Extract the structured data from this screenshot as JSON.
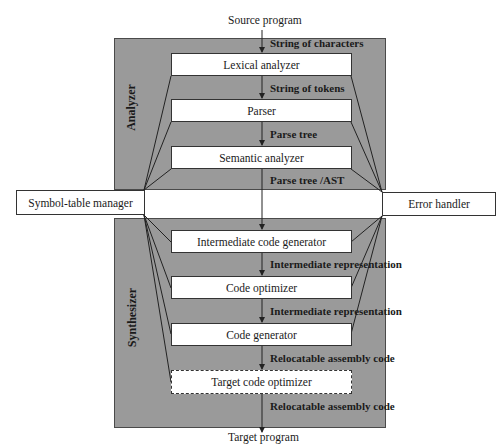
{
  "diagram": {
    "input": "Source program",
    "output": "Target program",
    "phases": {
      "analyzer": {
        "label": "Analyzer",
        "stages": [
          {
            "name": "Lexical analyzer",
            "input_edge": "String of characters"
          },
          {
            "name": "Parser",
            "input_edge": "String of tokens"
          },
          {
            "name": "Semantic analyzer",
            "input_edge": "Parse tree"
          }
        ],
        "output_edge": "Parse tree /AST"
      },
      "synthesizer": {
        "label": "Synthesizer",
        "stages": [
          {
            "name": "Intermediate code generator",
            "style": "solid"
          },
          {
            "name": "Code optimizer",
            "input_edge": "Intermediate representation",
            "style": "solid"
          },
          {
            "name": "Code generator",
            "input_edge": "Intermediate representation",
            "style": "solid"
          },
          {
            "name": "Target code optimizer",
            "input_edge": "Relocatable assembly code",
            "style": "dashed"
          }
        ],
        "output_edge": "Relocatable assembly code"
      }
    },
    "side_components": {
      "left": "Symbol-table manager",
      "right": "Error handler"
    },
    "colors": {
      "panel_fill": "#9a9a9a",
      "box_fill": "#ffffff",
      "line": "#222222"
    }
  }
}
